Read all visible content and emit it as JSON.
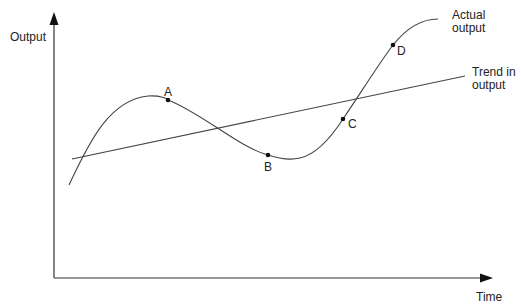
{
  "title": "",
  "axes": {
    "y_label": "Output",
    "x_label": "Time"
  },
  "curves": {
    "actual": {
      "label_line1": "Actual",
      "label_line2": "output",
      "color": "#444444"
    },
    "trend": {
      "label_line1": "Trend in",
      "label_line2": "output",
      "color": "#444444"
    }
  },
  "points": [
    {
      "label": "A",
      "x": 168,
      "y": 100
    },
    {
      "label": "B",
      "x": 268,
      "y": 155
    },
    {
      "label": "C",
      "x": 343,
      "y": 119
    },
    {
      "label": "D",
      "x": 393,
      "y": 45
    }
  ]
}
